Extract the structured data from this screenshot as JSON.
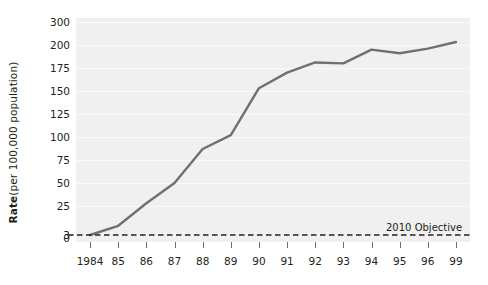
{
  "chart_data": {
    "type": "line",
    "title": "",
    "subtitle": "",
    "xlabel": "",
    "ylabel": "Rate (per 100,000 population)",
    "ylabel_bold_prefix": "Rate",
    "ylabel_rest": " (per 100,000 population)",
    "grid": true,
    "legend_position": "none",
    "x": [
      "1984",
      "85",
      "86",
      "87",
      "88",
      "89",
      "90",
      "91",
      "92",
      "93",
      "94",
      "95",
      "96",
      "99"
    ],
    "categories": [
      "1984",
      "85",
      "86",
      "87",
      "88",
      "89",
      "90",
      "91",
      "92",
      "93",
      "94",
      "95",
      "96",
      "99"
    ],
    "values": [
      3,
      10,
      28,
      50,
      87,
      102,
      153,
      170,
      181,
      180,
      195,
      191,
      196,
      213
    ],
    "series": [
      {
        "name": "Rate",
        "color": "#6e7073",
        "values": [
          3,
          10,
          28,
          50,
          87,
          102,
          153,
          170,
          181,
          180,
          195,
          191,
          196,
          213
        ]
      }
    ],
    "y_tick_labels": [
      "300",
      "200",
      "175",
      "150",
      "125",
      "100",
      "75",
      "50",
      "25",
      "3",
      "0"
    ],
    "y_tick_values": [
      300,
      200,
      175,
      150,
      125,
      100,
      75,
      50,
      25,
      3,
      0
    ],
    "ylim": [
      0,
      300
    ],
    "y_axis_note": "axis is broken between 200 and 300",
    "reference_line": {
      "label": "2010 Objective",
      "value": 3,
      "style": "dashed",
      "color": "#231f20"
    },
    "colors": {
      "plot_background": "#f0f0f0",
      "gridline": "#fafafa",
      "line": "#6e7073",
      "text": "#231f20",
      "page_background": "#ffffff"
    }
  }
}
